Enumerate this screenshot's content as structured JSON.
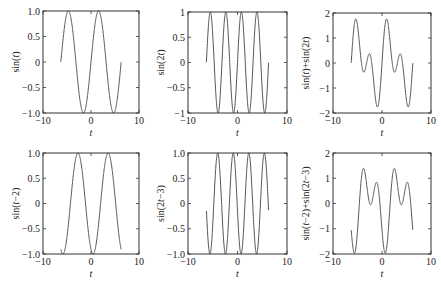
{
  "chart_data": [
    {
      "type": "line",
      "title": "",
      "xlabel": "t",
      "ylabel": "sin(t)",
      "xlim": [
        -10,
        10
      ],
      "ylim": [
        -1,
        1
      ],
      "xticks": [
        "-10",
        "0",
        "10"
      ],
      "yticks": [
        "1.0",
        "0.5",
        "0",
        "-0.5",
        "-1.0"
      ],
      "function": "sin(t)",
      "t_range": [
        -6.28,
        6.28
      ],
      "grid": false,
      "series": [
        {
          "name": "sin(t)",
          "x_start": -6.28,
          "x_end": 6.28,
          "y_start": 0,
          "y_end": 0,
          "max": 1,
          "min": -1
        }
      ]
    },
    {
      "type": "line",
      "title": "",
      "xlabel": "t",
      "ylabel": "sin(2t)",
      "xlim": [
        -10,
        10
      ],
      "ylim": [
        -1,
        1
      ],
      "xticks": [
        "-10",
        "0",
        "10"
      ],
      "yticks": [
        "1",
        "0.5",
        "0",
        "-0.5",
        "-1"
      ],
      "function": "sin(2t)",
      "t_range": [
        -6.28,
        6.28
      ],
      "grid": false,
      "series": [
        {
          "name": "sin(2t)",
          "x_start": -6.28,
          "x_end": 6.28,
          "y_start": 0,
          "y_end": 0,
          "max": 1,
          "min": -1
        }
      ]
    },
    {
      "type": "line",
      "title": "",
      "xlabel": "t",
      "ylabel": "sin(t)+sin(2t)",
      "xlim": [
        -10,
        10
      ],
      "ylim": [
        -2,
        2
      ],
      "xticks": [
        "-10",
        "0",
        "10"
      ],
      "yticks": [
        "2",
        "1",
        "0",
        "-1",
        "-2"
      ],
      "function": "sin(t)+sin(2t)",
      "t_range": [
        -6.28,
        6.28
      ],
      "grid": false,
      "series": [
        {
          "name": "sin(t)+sin(2t)",
          "x_start": -6.28,
          "x_end": 6.28,
          "max": 1.76,
          "min": -1.76
        }
      ]
    },
    {
      "type": "line",
      "title": "",
      "xlabel": "t",
      "ylabel": "sin(t−2)",
      "xlim": [
        -10,
        10
      ],
      "ylim": [
        -1,
        1
      ],
      "xticks": [
        "-10",
        "0",
        "10"
      ],
      "yticks": [
        "1.0",
        "0.5",
        "0",
        "-0.5",
        "-1.0"
      ],
      "function": "sin(t-2)",
      "t_range": [
        -6.28,
        6.28
      ],
      "grid": false,
      "series": [
        {
          "name": "sin(t-2)",
          "x_start": -6.28,
          "x_end": 6.28,
          "y_start": -0.91,
          "y_end": -0.91,
          "max": 1,
          "min": -1
        }
      ]
    },
    {
      "type": "line",
      "title": "",
      "xlabel": "t",
      "ylabel": "sin(2t−3)",
      "xlim": [
        -10,
        10
      ],
      "ylim": [
        -1,
        1
      ],
      "xticks": [
        "-10",
        "0",
        "10"
      ],
      "yticks": [
        "1.0",
        "0.5",
        "0",
        "-0.5",
        "-1.0"
      ],
      "function": "sin(2t-3)",
      "t_range": [
        -6.28,
        6.28
      ],
      "grid": false,
      "series": [
        {
          "name": "sin(2t-3)",
          "x_start": -6.28,
          "x_end": 6.28,
          "y_start": -0.14,
          "y_end": -0.14,
          "max": 1,
          "min": -1
        }
      ]
    },
    {
      "type": "line",
      "title": "",
      "xlabel": "t",
      "ylabel": "sin(t−2)+sin(2t−3)",
      "xlim": [
        -10,
        10
      ],
      "ylim": [
        -2,
        2
      ],
      "xticks": [
        "-10",
        "0",
        "10"
      ],
      "yticks": [
        "2",
        "1",
        "0",
        "-1",
        "-2"
      ],
      "function": "sin(t-2)+sin(2t-3)",
      "t_range": [
        -6.28,
        6.28
      ],
      "grid": false,
      "series": [
        {
          "name": "sin(t-2)+sin(2t-3)",
          "x_start": -6.28,
          "x_end": 6.28,
          "y_start": -1.05,
          "y_end": -1.05,
          "max": 1.4,
          "min": -2.0
        }
      ]
    }
  ],
  "style": {
    "line_color": "#555555",
    "axis_color": "#333333"
  }
}
